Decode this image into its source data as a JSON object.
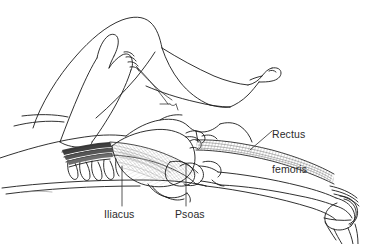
{
  "figure": {
    "kind": "anatomical-line-drawing",
    "background_color": "#ffffff",
    "ink_color": "#1a1a1a",
    "shade_color": "#6b6b6b",
    "text_color": "#2b2b2b"
  },
  "labels": {
    "rectus_femoris": {
      "line1": "Rectus",
      "line2": "femoris"
    },
    "iliacus": "Iliacus",
    "psoas": "Psoas"
  },
  "leaders": {
    "rectus_femoris": "diagonal-leader-line",
    "iliacus": "vertical-leader-line",
    "psoas": "vertical-leader-line"
  },
  "anatomy_parts": [
    "flexed-thigh",
    "lower-leg",
    "foot",
    "examiner-hand",
    "torso-outline",
    "pelvis-ilium",
    "sacrum",
    "ribs",
    "lumbar-vertebrae",
    "femur",
    "knee-joint",
    "patella",
    "tibia",
    "fibula",
    "psoas-major-muscle",
    "iliacus-muscle",
    "rectus-femoris-muscle"
  ]
}
